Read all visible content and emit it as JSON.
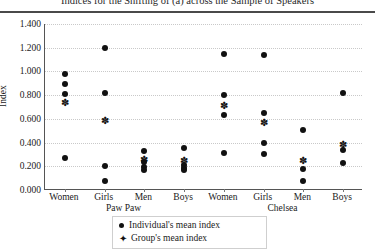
{
  "chart_data": {
    "type": "scatter",
    "title": "Indices for the Shifting of (a) across the Sample of Speakers",
    "xlabel": "",
    "ylabel": "Index",
    "ylim": [
      0.0,
      1.4
    ],
    "ytick_labels": [
      "0.000",
      "0.200",
      "0.400",
      "0.600",
      "0.800",
      "1.000",
      "1.200",
      "1.400"
    ],
    "ytick_values": [
      0.0,
      0.2,
      0.4,
      0.6,
      0.8,
      1.0,
      1.2,
      1.4
    ],
    "grid": "horizontal-dotted",
    "legend_position": "bottom-center",
    "legend": [
      {
        "label": "Individual's mean index",
        "marker": "filled-circle"
      },
      {
        "label": "Group's mean index",
        "marker": "open-diamond"
      }
    ],
    "groups": [
      {
        "name": "Paw Paw",
        "categories": [
          {
            "label": "Women",
            "individual_values": [
              0.98,
              0.89,
              0.81,
              0.27
            ],
            "group_mean": 0.745
          },
          {
            "label": "Girls",
            "individual_values": [
              1.2,
              0.82,
              0.2,
              0.08
            ],
            "group_mean": 0.59
          },
          {
            "label": "Men",
            "individual_values": [
              0.33,
              0.24,
              0.195,
              0.165
            ],
            "group_mean": 0.265
          },
          {
            "label": "Boys",
            "individual_values": [
              0.355,
              0.21,
              0.185,
              0.165
            ],
            "group_mean": 0.25
          }
        ]
      },
      {
        "name": "Chelsea",
        "categories": [
          {
            "label": "Women",
            "individual_values": [
              1.15,
              0.8,
              0.63,
              0.31
            ],
            "group_mean": 0.72
          },
          {
            "label": "Girls",
            "individual_values": [
              1.14,
              0.65,
              0.4,
              0.3
            ],
            "group_mean": 0.57
          },
          {
            "label": "Men",
            "individual_values": [
              0.51,
              0.18,
              0.08
            ],
            "group_mean": 0.255
          },
          {
            "label": "Boys",
            "individual_values": [
              0.82,
              0.34,
              0.23
            ],
            "group_mean": 0.39
          }
        ]
      }
    ]
  }
}
